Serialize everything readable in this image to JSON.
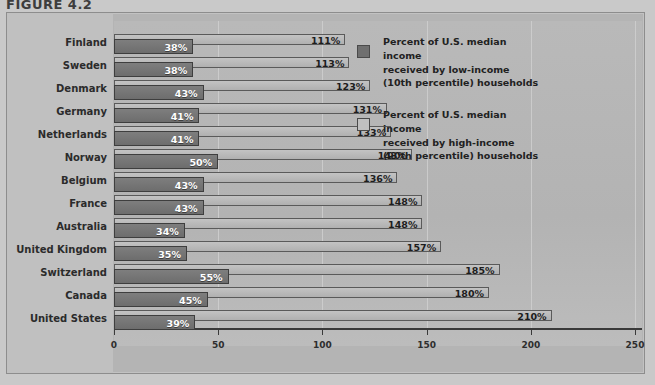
{
  "figure": {
    "title": "FIGURE 4.2"
  },
  "axis": {
    "ticks": [
      "0",
      "50",
      "100",
      "150",
      "200",
      "250"
    ],
    "min": 0,
    "max": 250
  },
  "legend": {
    "items": [
      {
        "swatch": "low-income-swatch",
        "color": "#6f6f6f",
        "line1": "Percent of U.S. median income",
        "line2": "received by low-income",
        "line3": "(10th percentile) households"
      },
      {
        "swatch": "high-income-swatch",
        "color": "#c0c0c0",
        "line1": "Percent of U.S. median income",
        "line2": "received by high-income",
        "line3": "(90th percentile) households"
      }
    ]
  },
  "chart_data": {
    "type": "bar",
    "orientation": "horizontal",
    "title": "FIGURE 4.2",
    "xlabel": "",
    "ylabel": "",
    "xlim": [
      0,
      250
    ],
    "xticks": [
      0,
      50,
      100,
      150,
      200,
      250
    ],
    "grid": true,
    "legend_position": "right-inside",
    "categories": [
      "Finland",
      "Sweden",
      "Denmark",
      "Germany",
      "Netherlands",
      "Norway",
      "Belgium",
      "France",
      "Australia",
      "United Kingdom",
      "Switzerland",
      "Canada",
      "United States"
    ],
    "series": [
      {
        "name": "Percent of U.S. median income received by low-income (10th percentile) households",
        "color": "#6f6f6f",
        "values": [
          38,
          38,
          43,
          41,
          41,
          50,
          43,
          43,
          34,
          35,
          55,
          45,
          39
        ],
        "labels": [
          "38%",
          "38%",
          "43%",
          "41%",
          "41%",
          "50%",
          "43%",
          "43%",
          "34%",
          "35%",
          "55%",
          "45%",
          "39%"
        ]
      },
      {
        "name": "Percent of U.S. median income received by high-income (90th percentile) households",
        "color": "#c0c0c0",
        "values": [
          111,
          113,
          123,
          131,
          133,
          143,
          136,
          148,
          148,
          157,
          185,
          180,
          210
        ],
        "labels": [
          "111%",
          "113%",
          "123%",
          "131%",
          "133%",
          "143%",
          "136%",
          "148%",
          "148%",
          "157%",
          "185%",
          "180%",
          "210%"
        ]
      }
    ]
  }
}
